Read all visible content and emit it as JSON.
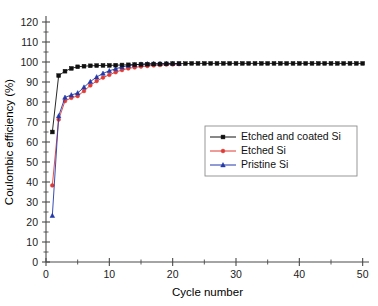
{
  "chart_data": {
    "type": "line",
    "title": "",
    "xlabel": "Cycle number",
    "ylabel": "Coulombic efficiency (%)",
    "xlim": [
      0,
      51
    ],
    "ylim": [
      0,
      120
    ],
    "xticks": [
      0,
      10,
      20,
      30,
      40,
      50
    ],
    "yticks": [
      0,
      10,
      20,
      30,
      40,
      50,
      60,
      70,
      80,
      90,
      100,
      110,
      120
    ],
    "x_minor_step": 5,
    "grid": false,
    "legend_position": "center-right",
    "series": [
      {
        "name": "Etched and coated Si",
        "color": "#101010",
        "marker": "square",
        "x": [
          1,
          2,
          3,
          4,
          5,
          6,
          7,
          8,
          9,
          10,
          11,
          12,
          13,
          14,
          15,
          16,
          17,
          18,
          19,
          20,
          21,
          22,
          23,
          24,
          25,
          26,
          27,
          28,
          29,
          30,
          31,
          32,
          33,
          34,
          35,
          36,
          37,
          38,
          39,
          40,
          41,
          42,
          43,
          44,
          45,
          46,
          47,
          48,
          49,
          50
        ],
        "y": [
          65.0,
          93.2,
          95.4,
          96.8,
          97.6,
          97.9,
          98.1,
          98.2,
          98.3,
          98.3,
          98.4,
          98.5,
          98.6,
          98.7,
          98.8,
          98.9,
          99.0,
          99.0,
          99.1,
          99.2,
          99.2,
          99.2,
          99.3,
          99.3,
          99.3,
          99.3,
          99.3,
          99.3,
          99.3,
          99.3,
          99.3,
          99.3,
          99.3,
          99.3,
          99.3,
          99.3,
          99.3,
          99.3,
          99.3,
          99.3,
          99.3,
          99.3,
          99.3,
          99.3,
          99.3,
          99.3,
          99.3,
          99.3,
          99.3,
          99.3
        ]
      },
      {
        "name": "Etched Si",
        "color": "#e03a34",
        "marker": "circle",
        "x": [
          1,
          2,
          3,
          4,
          5,
          6,
          7,
          8,
          9,
          10,
          11,
          12,
          13,
          14,
          15,
          16,
          17,
          18,
          19,
          20,
          21
        ],
        "y": [
          38.3,
          71.2,
          80.5,
          82.1,
          83.0,
          85.5,
          88.3,
          90.5,
          92.2,
          93.6,
          94.9,
          96.0,
          96.8,
          97.3,
          97.7,
          98.0,
          98.3,
          98.5,
          98.7,
          98.8,
          98.9
        ]
      },
      {
        "name": "Pristine Si",
        "color": "#2338a8",
        "marker": "triangle",
        "x": [
          1,
          2,
          3,
          4,
          5,
          6,
          7,
          8,
          9,
          10,
          11,
          12,
          13,
          14,
          15,
          16,
          17,
          18,
          19,
          20,
          21
        ],
        "y": [
          23.2,
          73.0,
          82.3,
          83.5,
          84.5,
          87.4,
          90.2,
          92.5,
          94.3,
          95.6,
          96.6,
          97.5,
          98.2,
          98.6,
          98.9,
          99.1,
          99.2,
          99.2,
          99.3,
          99.3,
          99.2
        ]
      }
    ]
  },
  "legend": {
    "entries": [
      {
        "label": "Etched and coated Si"
      },
      {
        "label": "Etched Si"
      },
      {
        "label": "Pristine Si"
      }
    ]
  }
}
